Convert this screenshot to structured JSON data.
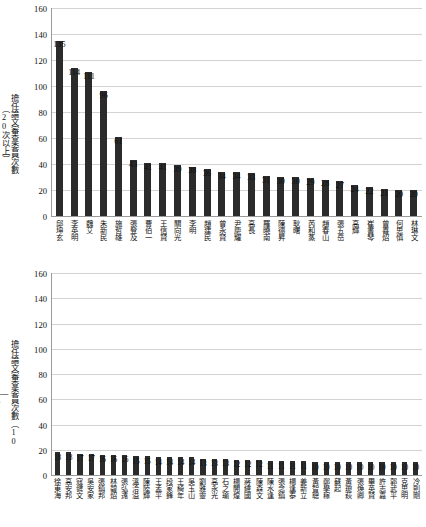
{
  "chart_data": [
    {
      "type": "bar",
      "title": "",
      "ylabel": "擔任論文審查委員次數（20次以上）",
      "xlabel": "",
      "ylim": [
        0,
        160
      ],
      "yticks": [
        0,
        20,
        40,
        60,
        80,
        100,
        120,
        140,
        160
      ],
      "grid": true,
      "legend": "none",
      "bar_color": "#2b2b2b",
      "categories": [
        "邱坤玄",
        "李英明",
        "魏艾",
        "朱新民",
        "施哲雄",
        "張登及",
        "曹伯一",
        "王信賢",
        "關向光",
        "李明",
        "趙建民",
        "曾永賢",
        "尹慶耀",
        "高長",
        "羅曉南",
        "陳德昇",
        "耿曙",
        "芮和蒸",
        "趙春山",
        "張五岳",
        "高輝",
        "崔書琴",
        "曾喜炤",
        "何思慎",
        "林琳文"
      ],
      "values": [
        135,
        114,
        111,
        96,
        61,
        43,
        41,
        41,
        39,
        38,
        36,
        34,
        34,
        33,
        31,
        30,
        30,
        29,
        28,
        27,
        24,
        22,
        21,
        20,
        20
      ]
    },
    {
      "type": "bar",
      "title": "",
      "ylabel": "擔任論文審查委員次數（10—19次）",
      "xlabel": "",
      "ylim": [
        0,
        160
      ],
      "yticks": [
        0,
        20,
        40,
        60,
        80,
        100,
        120,
        140,
        160
      ],
      "grid": true,
      "legend": "none",
      "bar_color": "#2b2b2b",
      "categories": [
        "徐東海",
        "高安邦",
        "寇健文",
        "吳安家",
        "張鎮邦",
        "林碧炤",
        "張弘遠",
        "溫洽溢",
        "陳陸輝",
        "王孟平",
        "段家鋒",
        "王綺年",
        "吳玉山",
        "劉雅靈",
        "高永光",
        "石之瑜",
        "楊開煌",
        "蔣緯國",
        "陳森文",
        "陳水逢",
        "張念鎮",
        "楊逢泰",
        "姜新立",
        "黃智聰",
        "鄭學稼",
        "蘇起",
        "黃瓊萩",
        "張煥卿",
        "畢英賢",
        "許志嘉",
        "郭武平",
        "克思明",
        "冷則剛"
      ],
      "values": [
        18,
        18,
        17,
        17,
        16,
        16,
        16,
        15,
        15,
        14,
        14,
        14,
        14,
        13,
        13,
        13,
        12,
        12,
        12,
        11,
        11,
        11,
        11,
        10,
        10,
        10,
        10,
        10,
        10,
        10,
        10,
        10,
        10
      ]
    }
  ],
  "ytitle_top": [
    "擔任論文審查委員次數",
    "（20次以上）"
  ],
  "ytitle_bottom": [
    "擔任論文審查委員次數（10",
    "—",
    "19次）"
  ]
}
